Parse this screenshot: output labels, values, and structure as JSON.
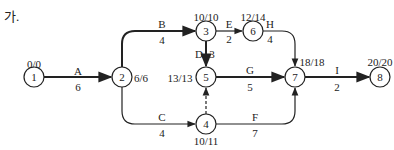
{
  "title": "가.",
  "nodes": [
    {
      "id": "1",
      "x": 34,
      "y": 77,
      "times": "0/0",
      "times_pos": [
        34,
        64
      ]
    },
    {
      "id": "2",
      "x": 122,
      "y": 77,
      "times": "6/6",
      "times_pos": [
        140,
        78
      ]
    },
    {
      "id": "3",
      "x": 206,
      "y": 31,
      "times": "10/10",
      "times_pos": [
        206,
        18
      ]
    },
    {
      "id": "6",
      "x": 253,
      "y": 31,
      "times": "12/14",
      "times_pos": [
        253,
        18
      ]
    },
    {
      "id": "5",
      "x": 206,
      "y": 77,
      "times": "13/13",
      "times_pos": [
        180,
        78
      ]
    },
    {
      "id": "4",
      "x": 206,
      "y": 124,
      "times": "10/11",
      "times_pos": [
        206,
        141
      ]
    },
    {
      "id": "7",
      "x": 295,
      "y": 77,
      "times": "18/18",
      "times_pos": [
        311,
        62
      ]
    },
    {
      "id": "8",
      "x": 380,
      "y": 77,
      "times": "20/20",
      "times_pos": [
        380,
        62
      ]
    }
  ],
  "activities": [
    {
      "name": "A",
      "duration": "6",
      "from": "1",
      "to": "2",
      "critical": true,
      "name_pos": [
        78,
        71
      ],
      "dur_pos": [
        78,
        87
      ]
    },
    {
      "name": "B",
      "duration": "4",
      "from": "2",
      "to": "3",
      "critical": true,
      "name_pos": [
        162,
        24
      ],
      "dur_pos": [
        162,
        40
      ]
    },
    {
      "name": "E",
      "duration": "2",
      "from": "3",
      "to": "6",
      "critical": false,
      "name_pos": [
        229,
        24
      ],
      "dur_pos": [
        229,
        40
      ]
    },
    {
      "name": "D",
      "duration": "3",
      "from": "3",
      "to": "5",
      "critical": true,
      "name_pos": [
        199,
        54
      ],
      "dur_pos": [
        212,
        54
      ]
    },
    {
      "name": "H",
      "duration": "4",
      "from": "6",
      "to": "7",
      "critical": false,
      "name_pos": [
        270,
        24
      ],
      "dur_pos": [
        270,
        40
      ]
    },
    {
      "name": "G",
      "duration": "5",
      "from": "5",
      "to": "7",
      "critical": true,
      "name_pos": [
        250,
        71
      ],
      "dur_pos": [
        250,
        87
      ]
    },
    {
      "name": "C",
      "duration": "4",
      "from": "2",
      "to": "4",
      "critical": false,
      "name_pos": [
        162,
        117
      ],
      "dur_pos": [
        162,
        133
      ]
    },
    {
      "name": "F",
      "duration": "7",
      "from": "4",
      "to": "7",
      "critical": false,
      "name_pos": [
        255,
        117
      ],
      "dur_pos": [
        255,
        133
      ]
    },
    {
      "name": "I",
      "duration": "2",
      "from": "7",
      "to": "8",
      "critical": true,
      "name_pos": [
        337,
        71
      ],
      "dur_pos": [
        337,
        87
      ]
    }
  ],
  "dummy": {
    "from": "4",
    "to": "5"
  },
  "colors": {
    "line": "#222222",
    "node_fill": "#ffffff"
  }
}
